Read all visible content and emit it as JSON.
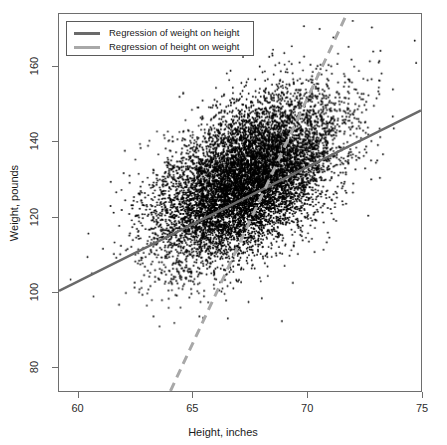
{
  "chart_data": {
    "type": "scatter",
    "title": "",
    "xlabel": "Height, inches",
    "ylabel": "Weight, pounds",
    "xlim": [
      59.15,
      75.0
    ],
    "ylim": [
      73.5,
      174.0
    ],
    "xticks": [
      60,
      65,
      70,
      75
    ],
    "xticklabels": [
      "60",
      "65",
      "70",
      "75"
    ],
    "yticks": [
      80,
      100,
      120,
      140,
      160
    ],
    "yticklabels": [
      "80",
      "100",
      "120",
      "140",
      "160"
    ],
    "grid": false,
    "n_points": 9800,
    "point_color": "#000000",
    "point_size_px": 1.9,
    "scatter_description": "Dense positively-correlated cloud of height vs weight observations; core is near-solid black with sparse outliers at the margins.",
    "cloud": {
      "x_mean": 67.4,
      "x_sd": 1.95,
      "y_mean": 130.0,
      "y_sd": 11.0,
      "correlation": 0.52
    },
    "series": [
      {
        "name": "Regression of weight on height",
        "type": "line",
        "style": "solid",
        "color": "#6a6a6a",
        "width_px": 2.6,
        "endpoints": [
          [
            59.15,
            100.2
          ],
          [
            75.0,
            148.3
          ]
        ],
        "slope": 3.03,
        "intercept": -79.1
      },
      {
        "name": "Regression of height on weight",
        "type": "line",
        "style": "dashed",
        "color": "#a8a8a8",
        "width_px": 3.0,
        "dash_px": [
          9,
          6
        ],
        "endpoints": [
          [
            64.03,
            73.5
          ],
          [
            71.75,
            174.0
          ]
        ],
        "slope": 13.02,
        "intercept": -760.3
      }
    ],
    "legend": {
      "position": "top-left",
      "border_color": "#5a5a5a",
      "entries": [
        {
          "label": "Regression of weight on height",
          "style": "solid",
          "color": "#6a6a6a"
        },
        {
          "label": "Regression of height on weight",
          "style": "dashed",
          "color": "#a8a8a8"
        }
      ]
    }
  },
  "axes": {
    "x_title": "Height, inches",
    "y_title": "Weight, pounds",
    "x_tick_labels": [
      "60",
      "65",
      "70",
      "75"
    ],
    "y_tick_labels": [
      "80",
      "100",
      "120",
      "140",
      "160"
    ]
  },
  "legend": {
    "items": [
      {
        "label": "Regression of weight on height"
      },
      {
        "label": "Regression of height on weight"
      }
    ]
  }
}
